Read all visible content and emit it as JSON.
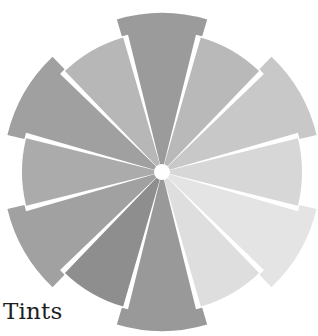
{
  "caption": "Tints",
  "wheel": {
    "center": [
      162,
      172
    ],
    "inner_radius": 0,
    "normal_radius": 140,
    "extended_radius": 159,
    "gap_color": "#ffffff",
    "center_dot_radius": 8,
    "segments": [
      {
        "position": "12 o'clock",
        "angle": -90,
        "extended": true,
        "color": "#9b9b9b"
      },
      {
        "position": "1 o'clock",
        "angle": -60,
        "extended": false,
        "color": "#b9b9b9"
      },
      {
        "position": "2 o'clock",
        "angle": -30,
        "extended": true,
        "color": "#c8c8c8"
      },
      {
        "position": "3 o'clock",
        "angle": 0,
        "extended": false,
        "color": "#d7d7d7"
      },
      {
        "position": "4 o'clock",
        "angle": 30,
        "extended": true,
        "color": "#e4e4e4"
      },
      {
        "position": "5 o'clock",
        "angle": 60,
        "extended": false,
        "color": "#dedede"
      },
      {
        "position": "6 o'clock",
        "angle": 90,
        "extended": true,
        "color": "#999999"
      },
      {
        "position": "7 o'clock",
        "angle": 120,
        "extended": false,
        "color": "#8e8e8e"
      },
      {
        "position": "8 o'clock",
        "angle": 150,
        "extended": true,
        "color": "#a1a1a1"
      },
      {
        "position": "9 o'clock",
        "angle": 180,
        "extended": false,
        "color": "#ababab"
      },
      {
        "position": "10 o'clock",
        "angle": 210,
        "extended": true,
        "color": "#a0a0a0"
      },
      {
        "position": "11 o'clock",
        "angle": 240,
        "extended": false,
        "color": "#b7b7b7"
      }
    ]
  }
}
